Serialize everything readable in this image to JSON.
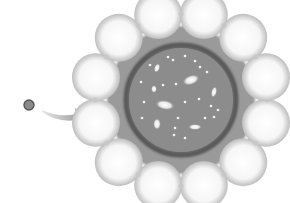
{
  "diagram": {
    "source_dot": {
      "cx": 29,
      "cy": 105,
      "r": 5,
      "fill": "#8a8a8a",
      "stroke": "#555555"
    },
    "arrow": {
      "from": [
        42,
        112
      ],
      "to": [
        88,
        117
      ],
      "color": "#9a9a9a"
    },
    "universe": {
      "cx": 181,
      "cy": 100,
      "r": 52,
      "fill": "#8c8c8c",
      "ring_color": "#5a5a5a",
      "scallop_count": 12,
      "outer_radius": 78
    },
    "galaxies": [
      {
        "x": 191,
        "y": 80,
        "rx": 9,
        "ry": 5,
        "rot": -20
      },
      {
        "x": 165,
        "y": 105,
        "rx": 10,
        "ry": 5,
        "rot": 10
      },
      {
        "x": 157,
        "y": 124,
        "rx": 4,
        "ry": 6,
        "rot": 0
      },
      {
        "x": 195,
        "y": 127,
        "rx": 7,
        "ry": 3,
        "rot": 0
      },
      {
        "x": 214,
        "y": 92,
        "rx": 3,
        "ry": 6,
        "rot": 15
      },
      {
        "x": 154,
        "y": 89,
        "rx": 3,
        "ry": 4,
        "rot": 0
      },
      {
        "x": 157,
        "y": 68,
        "rx": 3,
        "ry": 5,
        "rot": 20
      }
    ],
    "stars": [
      [
        168,
        57
      ],
      [
        173,
        60
      ],
      [
        185,
        56
      ],
      [
        195,
        61
      ],
      [
        207,
        72
      ],
      [
        141,
        82
      ],
      [
        163,
        85
      ],
      [
        176,
        84
      ],
      [
        144,
        102
      ],
      [
        185,
        102
      ],
      [
        199,
        99
      ],
      [
        211,
        106
      ],
      [
        218,
        110
      ],
      [
        214,
        117
      ],
      [
        142,
        118
      ],
      [
        205,
        118
      ],
      [
        178,
        118
      ],
      [
        175,
        128
      ],
      [
        174,
        135
      ],
      [
        185,
        138
      ],
      [
        150,
        65
      ],
      [
        200,
        67
      ]
    ]
  }
}
